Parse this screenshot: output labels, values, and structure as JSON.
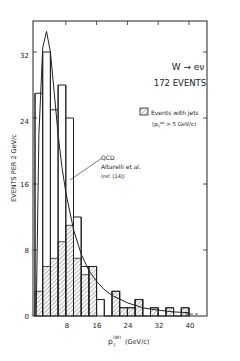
{
  "chart_data": {
    "type": "bar",
    "title": "W → eν",
    "subtitle": "172 EVENTS",
    "xlabel": "p_T^(W) (GeV/c)",
    "ylabel": "EVENTS PER 2 GeV/c",
    "xlim": [
      0,
      46
    ],
    "ylim": [
      0,
      36
    ],
    "x_ticks": [
      8,
      16,
      24,
      32,
      40
    ],
    "y_ticks": [
      0,
      8,
      16,
      24,
      32
    ],
    "bin_width": 2,
    "bin_edges": [
      0,
      2,
      4,
      6,
      8,
      10,
      12,
      14,
      16,
      18,
      20,
      22,
      24,
      26,
      28,
      30,
      32,
      34,
      36,
      38,
      40
    ],
    "series": [
      {
        "name": "All events",
        "style": "outline",
        "values": [
          27,
          32,
          25,
          28,
          24,
          12,
          6,
          6,
          2,
          0,
          3,
          1,
          1,
          2,
          0,
          1,
          0,
          1,
          0,
          1
        ]
      },
      {
        "name": "Events with jets (p_T^jet > 5 GeV/c)",
        "style": "hatched",
        "values": [
          3,
          6,
          7,
          9,
          11,
          7,
          5,
          6,
          0,
          0,
          3,
          1,
          1,
          2,
          0,
          1,
          0,
          1,
          0,
          1
        ]
      }
    ],
    "curve": {
      "name": "QCD Altarelli et al. (ref. [14])",
      "x": [
        0.3,
        1,
        2,
        3,
        4,
        5,
        6,
        7,
        8,
        10,
        12,
        14,
        16,
        18,
        20,
        24,
        28,
        32,
        36,
        40
      ],
      "y": [
        0,
        22,
        32.5,
        34.5,
        32,
        27,
        22,
        18,
        15,
        10.5,
        7.5,
        5.5,
        4.2,
        3.2,
        2.5,
        1.6,
        1.0,
        0.7,
        0.5,
        0.4
      ]
    },
    "legend": {
      "hatched_label": "Events with jets",
      "hatched_sublabel": "(p_T^jet > 5 GeV/c)",
      "curve_label_lines": [
        "QCD",
        "Altarelli et al.",
        "(ref. [14])"
      ]
    },
    "grid": false
  },
  "labels": {
    "title": "W → eν",
    "subtitle": "172 EVENTS",
    "ylabel": "EVENTS PER 2 GeV/c",
    "xlabel_main": "p",
    "xlabel_sub": "T",
    "xlabel_sup": "(W)",
    "xlabel_unit": "(GeV/c)",
    "legend_line1": "Events with jets",
    "legend_line2": "(p  > 5 GeV/c)",
    "qcd_line1": "QCD",
    "qcd_line2": "Altarelli et al.",
    "qcd_line3": "(ref. [14])",
    "xtick_8": "8",
    "xtick_16": "16",
    "xtick_24": "24",
    "xtick_32": "32",
    "xtick_40": "40",
    "ytick_0": "0",
    "ytick_8": "8",
    "ytick_16": "16",
    "ytick_24": "24",
    "ytick_32": "32"
  }
}
